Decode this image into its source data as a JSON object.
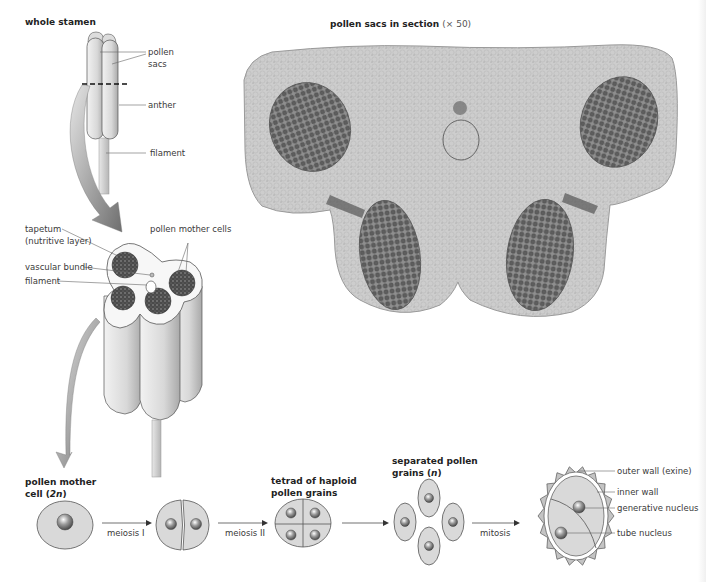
{
  "figure": {
    "whole_stamen": {
      "title": "whole stamen",
      "labels": {
        "pollen_sacs_1": "pollen",
        "pollen_sacs_2": "sacs",
        "anther": "anther",
        "filament": "filament"
      }
    },
    "section_photo": {
      "title": "pollen sacs in section",
      "magnification": "(× 50)"
    },
    "cross_section": {
      "labels": {
        "tapetum_1": "tapetum",
        "tapetum_2": "(nutritive layer)",
        "pollen_mother_cells": "pollen mother cells",
        "vascular_bundle": "vascular bundle",
        "filament": "filament"
      }
    },
    "sequence": {
      "stages": [
        {
          "title_1": "pollen mother",
          "title_2": "cell (",
          "title_n": "2n",
          "title_3": ")"
        },
        {
          "title_1": ""
        },
        {
          "title_1": "tetrad of haploid",
          "title_2": "pollen grains"
        },
        {
          "title_1": "separated pollen",
          "title_2": "grains (",
          "title_n": "n",
          "title_3": ")"
        }
      ],
      "arrows": [
        {
          "label": "meiosis I"
        },
        {
          "label": "meiosis II"
        },
        {
          "label": ""
        },
        {
          "label": "mitosis"
        }
      ]
    },
    "pollen_grain": {
      "labels": {
        "outer_wall": "outer wall (exine)",
        "inner_wall": "inner wall",
        "generative_nucleus": "generative nucleus",
        "tube_nucleus": "tube nucleus"
      }
    }
  },
  "colors": {
    "cell_fill": "#d9d9d9",
    "outline": "#555555",
    "arrow": "#7a7a7a",
    "photo_tissue": "#c8c8c8",
    "photo_sac": "#6e6e6e"
  }
}
